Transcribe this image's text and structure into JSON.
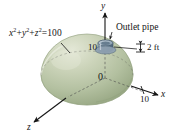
{
  "figure": {
    "background_color": "#ffffff",
    "ink_color": "#151515",
    "dome": {
      "name": "hemisphere-dome",
      "fill_light": "#d9ddc8",
      "fill_mid": "#b9c4a6",
      "fill_dark": "#93a37f",
      "edge_color": "#7e8c6c"
    },
    "pipe": {
      "name": "outlet-pipe",
      "fill_light": "#9fb2c2",
      "fill_dark": "#5c7386",
      "edge_color": "#44596b"
    },
    "equation": {
      "x_term": "x",
      "y_term": "y",
      "z_term": "z",
      "exponent": "2",
      "plus": "+",
      "equals": "=",
      "value": "100",
      "full_text": "x² + y² + z² = 100"
    },
    "labels": {
      "outlet_pipe": "Outlet pipe",
      "pipe_diameter": "2 ft",
      "origin": "0",
      "y_tick": "10",
      "x_tick": "10",
      "axis_x": "x",
      "axis_y": "y",
      "axis_z": "z"
    }
  }
}
